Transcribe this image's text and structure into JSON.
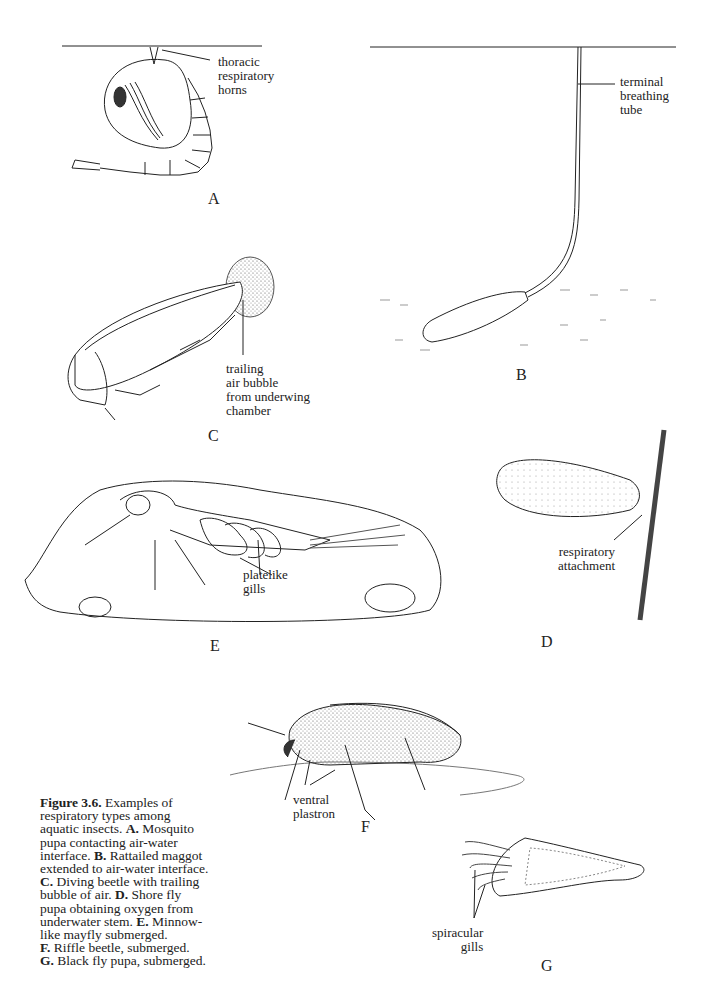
{
  "figure": {
    "caption": {
      "number": "Figure 3.6.",
      "intro": "Examples of respiratory types among aquatic insects.",
      "items": [
        {
          "key": "A.",
          "text": "Mosquito pupa contacting air-water interface."
        },
        {
          "key": "B.",
          "text": "Rattailed maggot extended to air-water interface."
        },
        {
          "key": "C.",
          "text": "Diving beetle with trailing bubble of air."
        },
        {
          "key": "D.",
          "text": "Shore fly pupa obtaining oxygen from underwater stem."
        },
        {
          "key": "E.",
          "text": "Minnow-like mayfly submerged."
        },
        {
          "key": "F.",
          "text": "Riffle beetle, submerged."
        },
        {
          "key": "G.",
          "text": "Black fly pupa, submerged."
        }
      ]
    },
    "panels": {
      "A": {
        "letter": "A",
        "label": "thoracic\nrespiratory\nhorns"
      },
      "B": {
        "letter": "B",
        "label": "terminal\nbreathing\ntube"
      },
      "C": {
        "letter": "C",
        "label": "trailing\nair bubble\nfrom underwing\nchamber"
      },
      "D": {
        "letter": "D",
        "label": "respiratory\nattachment"
      },
      "E": {
        "letter": "E",
        "label": "platelike\ngills"
      },
      "F": {
        "letter": "F",
        "label": "ventral\nplastron"
      },
      "G": {
        "letter": "G",
        "label": "spiracular\ngills"
      }
    }
  }
}
